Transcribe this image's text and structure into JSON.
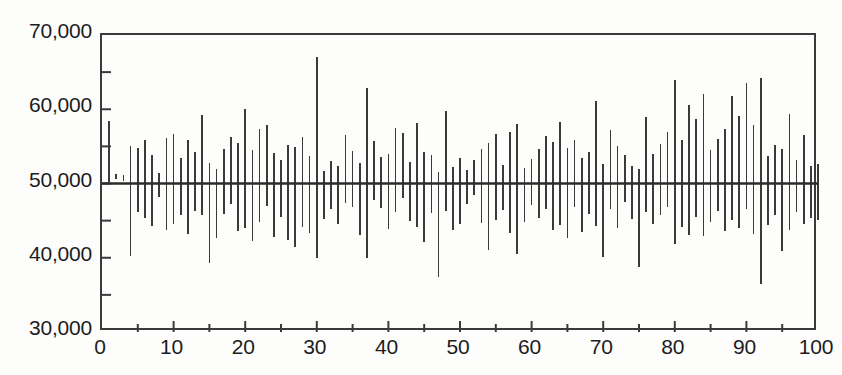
{
  "chart_data": {
    "type": "bar",
    "subtype": "high-low-range-segments",
    "title": "",
    "subtitle": "",
    "xlabel": "",
    "ylabel": "",
    "xlim": [
      0,
      100
    ],
    "ylim": [
      30000,
      70000
    ],
    "grid": false,
    "legend": null,
    "legend_position": "none",
    "reference_line": {
      "orientation": "horizontal",
      "value": 50000,
      "label": ""
    },
    "x_ticks_major": [
      0,
      10,
      20,
      30,
      40,
      50,
      60,
      70,
      80,
      90,
      100
    ],
    "x_tick_labels": [
      "0",
      "10",
      "20",
      "30",
      "40",
      "50",
      "60",
      "70",
      "80",
      "90",
      "100"
    ],
    "x_ticks_minor": [
      5,
      15,
      25,
      35,
      45,
      55,
      65,
      75,
      85,
      95
    ],
    "y_ticks_major": [
      30000,
      40000,
      50000,
      60000,
      70000
    ],
    "y_tick_labels": [
      "30,000",
      "40,000",
      "50,000",
      "60,000",
      "70,000"
    ],
    "y_ticks_minor": [
      35000,
      45000,
      55000,
      65000
    ],
    "series": [
      {
        "name": "interval",
        "x": [
          1,
          2,
          3,
          4,
          5,
          6,
          7,
          8,
          9,
          10,
          11,
          12,
          13,
          14,
          15,
          16,
          17,
          18,
          19,
          20,
          21,
          22,
          23,
          24,
          25,
          26,
          27,
          28,
          29,
          30,
          31,
          32,
          33,
          34,
          35,
          36,
          37,
          38,
          39,
          40,
          41,
          42,
          43,
          44,
          45,
          46,
          47,
          48,
          49,
          50,
          51,
          52,
          53,
          54,
          55,
          56,
          57,
          58,
          59,
          60,
          61,
          62,
          63,
          64,
          65,
          66,
          67,
          68,
          69,
          70,
          71,
          72,
          73,
          74,
          75,
          76,
          77,
          78,
          79,
          80,
          81,
          82,
          83,
          84,
          85,
          86,
          87,
          88,
          89,
          90,
          91,
          92,
          93,
          94,
          95,
          96,
          97,
          98,
          99,
          100
        ],
        "low": [
          50200,
          50600,
          50400,
          40300,
          46100,
          45300,
          44300,
          48200,
          43800,
          44500,
          45700,
          43200,
          46300,
          45800,
          39300,
          42700,
          45900,
          47300,
          43600,
          44000,
          42300,
          44800,
          47000,
          42800,
          45500,
          42400,
          41500,
          44100,
          43400,
          39900,
          45200,
          46500,
          44600,
          47400,
          46900,
          43100,
          40000,
          47800,
          46700,
          43900,
          46200,
          48100,
          44900,
          44200,
          42100,
          46000,
          37400,
          46300,
          43700,
          44500,
          47200,
          48400,
          44700,
          41000,
          45100,
          46400,
          43300,
          40500,
          44800,
          47100,
          45400,
          46600,
          43800,
          44400,
          42600,
          46800,
          43500,
          45900,
          44300,
          40100,
          46500,
          44000,
          47500,
          45200,
          38800,
          46200,
          44600,
          45800,
          46900,
          41800,
          44200,
          43100,
          45500,
          42900,
          44800,
          46300,
          43600,
          45100,
          44000,
          46600,
          43200,
          36500,
          44400,
          45700,
          40900,
          43800,
          46100,
          44500,
          45300,
          45100
        ],
        "high": [
          58400,
          51300,
          51200,
          55100,
          54800,
          55900,
          53800,
          51400,
          56100,
          56600,
          53500,
          55800,
          54200,
          59200,
          52700,
          51900,
          54700,
          56300,
          55400,
          60100,
          54500,
          57300,
          57900,
          54100,
          53200,
          55200,
          54900,
          56200,
          53700,
          67000,
          51700,
          53000,
          52400,
          56500,
          54400,
          52800,
          62800,
          55700,
          53600,
          54000,
          57500,
          56800,
          52900,
          58100,
          54300,
          53900,
          51500,
          59800,
          52200,
          53400,
          51800,
          53100,
          54600,
          55500,
          56700,
          52500,
          57000,
          58000,
          52100,
          53300,
          54700,
          56400,
          55600,
          58300,
          54800,
          55900,
          53500,
          54200,
          61100,
          52600,
          57200,
          55100,
          53800,
          52300,
          51900,
          58900,
          54000,
          55300,
          56900,
          64000,
          55800,
          60600,
          58700,
          62100,
          54500,
          56000,
          57400,
          61800,
          59100,
          63600,
          57900,
          64200,
          53700,
          55200,
          54600,
          59300,
          53100,
          56500,
          52400,
          52600
        ]
      }
    ]
  },
  "axes": {
    "y_labels": [
      "70,000",
      "60,000",
      "50,000",
      "40,000",
      "30,000"
    ],
    "x_labels": [
      "0",
      "10",
      "20",
      "30",
      "40",
      "50",
      "60",
      "70",
      "80",
      "90",
      "100"
    ]
  },
  "style": {
    "line_color": "#3a3a3a",
    "frame_color": "#3a3a3a",
    "reference_line_color": "#2b2b2b",
    "background": "#fdfdfc",
    "text_color": "#1c1c1c"
  }
}
